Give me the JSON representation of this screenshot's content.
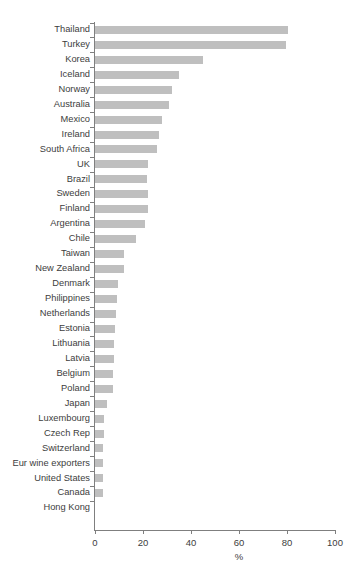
{
  "chart_data": {
    "type": "bar",
    "orientation": "horizontal",
    "title": "",
    "xlabel": "%",
    "ylabel": "",
    "xlim": [
      0,
      100
    ],
    "xticks": [
      0,
      20,
      40,
      60,
      80,
      100
    ],
    "grid": false,
    "legend": null,
    "bar_color": "#bfbfbf",
    "axis_color": "#7f7f7f",
    "text_color": "#3d3d3d",
    "categories": [
      "Thailand",
      "Turkey",
      "Korea",
      "Iceland",
      "Norway",
      "Australia",
      "Mexico",
      "Ireland",
      "South Africa",
      "UK",
      "Brazil",
      "Sweden",
      "Finland",
      "Argentina",
      "Chile",
      "Taiwan",
      "New Zealand",
      "Denmark",
      "Philippines",
      "Netherlands",
      "Estonia",
      "Lithuania",
      "Latvia",
      "Belgium",
      "Poland",
      "Japan",
      "Luxembourg",
      "Czech Rep",
      "Switzerland",
      "Eur wine exporters",
      "United States",
      "Canada",
      "Hong Kong"
    ],
    "values": [
      80.5,
      79.6,
      45.0,
      35.0,
      32.0,
      31.0,
      28.0,
      26.6,
      26.0,
      22.0,
      21.7,
      22.0,
      22.0,
      21.0,
      17.0,
      12.0,
      12.0,
      9.5,
      9.0,
      8.7,
      8.3,
      8.0,
      8.0,
      7.5,
      7.5,
      5.0,
      3.8,
      3.8,
      3.3,
      3.3,
      3.3,
      3.3,
      0.0
    ]
  }
}
